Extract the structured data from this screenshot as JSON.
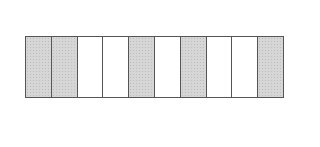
{
  "diagram": {
    "type": "fraction-strip",
    "total_parts": 10,
    "shaded_count": 5,
    "cells": [
      {
        "index": 1,
        "shaded": true
      },
      {
        "index": 2,
        "shaded": true
      },
      {
        "index": 3,
        "shaded": false
      },
      {
        "index": 4,
        "shaded": false
      },
      {
        "index": 5,
        "shaded": true
      },
      {
        "index": 6,
        "shaded": false
      },
      {
        "index": 7,
        "shaded": true
      },
      {
        "index": 8,
        "shaded": false
      },
      {
        "index": 9,
        "shaded": false
      },
      {
        "index": 10,
        "shaded": true
      }
    ],
    "colors": {
      "shaded": "#d6d6d6",
      "unshaded": "#ffffff",
      "border": "#555555"
    }
  }
}
